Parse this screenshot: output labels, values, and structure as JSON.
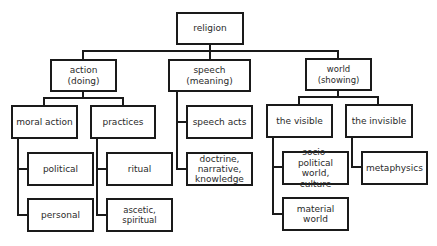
{
  "diagram": {
    "type": "tree",
    "root": {
      "label": "religion",
      "children": [
        {
          "label": "action (doing)",
          "children": [
            {
              "label": "moral action",
              "children": [
                {
                  "label": "political"
                },
                {
                  "label": "personal"
                }
              ]
            },
            {
              "label": "practices",
              "children": [
                {
                  "label": "ritual"
                },
                {
                  "label": "ascetic, spiritual"
                }
              ]
            }
          ]
        },
        {
          "label": "speech\n(meaning)",
          "children": [
            {
              "label": "speech acts"
            },
            {
              "label": "doctrine,\nnarrative,\nknowledge"
            }
          ]
        },
        {
          "label": "world (showing)",
          "children": [
            {
              "label": "the visible",
              "children": [
                {
                  "label": "socio-political\nworld, culture"
                },
                {
                  "label": "material world"
                }
              ]
            },
            {
              "label": "the invisible",
              "children": [
                {
                  "label": "metaphysics"
                }
              ]
            }
          ]
        }
      ]
    }
  },
  "nodes": {
    "religion": "religion",
    "action": "action (doing)",
    "speech": "speech\n(meaning)",
    "world": "world (showing)",
    "moral_action": "moral action",
    "practices": "practices",
    "speech_acts": "speech acts",
    "doctrine": "doctrine,\nnarrative,\nknowledge",
    "the_visible": "the visible",
    "the_invisible": "the invisible",
    "political": "political",
    "personal": "personal",
    "ritual": "ritual",
    "ascetic": "ascetic, spiritual",
    "socio_political": "socio-political\nworld, culture",
    "material_world": "material world",
    "metaphysics": "metaphysics"
  },
  "colors": {
    "line": "#1a1a1a",
    "text": "#2a2a2a",
    "background": "#ffffff"
  }
}
